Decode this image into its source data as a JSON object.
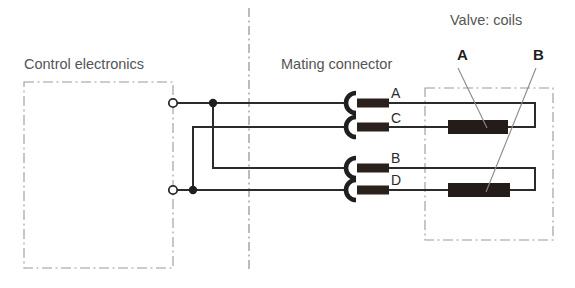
{
  "diagram": {
    "type": "electrical-wiring-schematic",
    "title_labels": {
      "control_electronics": "Control electronics",
      "mating_connector": "Mating connector",
      "valve_coils": "Valve: coils"
    },
    "pin_labels": [
      "A",
      "C",
      "B",
      "D"
    ],
    "coil_labels": [
      "A",
      "B"
    ],
    "terminals": [
      {
        "name": "upper-terminal",
        "x": 173,
        "y": 103,
        "style": "open-circle"
      },
      {
        "name": "lower-terminal",
        "x": 173,
        "y": 190,
        "style": "open-circle"
      }
    ],
    "junctions": [
      {
        "name": "upper-junction",
        "x": 213,
        "y": 103,
        "style": "filled-dot"
      },
      {
        "name": "lower-junction",
        "x": 193,
        "y": 190,
        "style": "filled-dot"
      }
    ],
    "wires": [
      {
        "name": "wire-a",
        "pin": "A",
        "from": "upper-terminal",
        "y": 103
      },
      {
        "name": "wire-c",
        "pin": "C",
        "from": "lower-junction",
        "y": 127
      },
      {
        "name": "wire-b",
        "pin": "B",
        "from": "upper-junction",
        "y": 168
      },
      {
        "name": "wire-d",
        "pin": "D",
        "from": "lower-terminal",
        "y": 190
      }
    ],
    "coils": [
      {
        "name": "coil-a",
        "label": "A",
        "pins": [
          "A",
          "C"
        ],
        "x": 448,
        "y": 120,
        "width": 60,
        "height": 14
      },
      {
        "name": "coil-b",
        "label": "B",
        "pins": [
          "B",
          "D"
        ],
        "x": 448,
        "y": 183,
        "width": 62,
        "height": 14
      }
    ],
    "boundaries": [
      {
        "name": "control-electronics-boundary",
        "x": 24,
        "y": 82,
        "width": 149,
        "height": 186,
        "style": "dash-dot"
      },
      {
        "name": "valve-boundary",
        "x": 425,
        "y": 88,
        "width": 128,
        "height": 152,
        "style": "dash-dot"
      },
      {
        "name": "center-separator",
        "x": 249,
        "y1": 8,
        "y2": 272,
        "style": "dash-dot-vertical"
      }
    ],
    "colors": {
      "line": "#2b2b2b",
      "dashed": "#8a8a8a",
      "coil_fill": "#241c18",
      "text": "#4a4a4a",
      "background": "#ffffff"
    }
  }
}
